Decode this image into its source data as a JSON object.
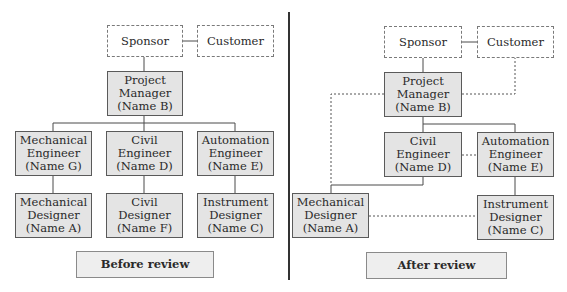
{
  "colors": {
    "box_fill": "#e4e4e4",
    "box_border": "#5a5a5a",
    "dashed_border": "#7a7a7a",
    "line": "#4a4a4a",
    "label_fill": "#eeeeee"
  },
  "before": {
    "caption": "Before review",
    "sponsor": "Sponsor",
    "customer": "Customer",
    "pm": {
      "l1": "Project",
      "l2": "Manager",
      "l3": "(Name B)"
    },
    "mech_eng": {
      "l1": "Mechanical",
      "l2": "Engineer",
      "l3": "(Name G)"
    },
    "civil_eng": {
      "l1": "Civil",
      "l2": "Engineer",
      "l3": "(Name D)"
    },
    "auto_eng": {
      "l1": "Automation",
      "l2": "Engineer",
      "l3": "(Name E)"
    },
    "mech_des": {
      "l1": "Mechanical",
      "l2": "Designer",
      "l3": "(Name A)"
    },
    "civil_des": {
      "l1": "Civil",
      "l2": "Designer",
      "l3": "(Name F)"
    },
    "inst_des": {
      "l1": "Instrument",
      "l2": "Designer",
      "l3": "(Name C)"
    }
  },
  "after": {
    "caption": "After review",
    "sponsor": "Sponsor",
    "customer": "Customer",
    "pm": {
      "l1": "Project",
      "l2": "Manager",
      "l3": "(Name B)"
    },
    "civil_eng": {
      "l1": "Civil",
      "l2": "Engineer",
      "l3": "(Name D)"
    },
    "auto_eng": {
      "l1": "Automation",
      "l2": "Engineer",
      "l3": "(Name E)"
    },
    "mech_des": {
      "l1": "Mechanical",
      "l2": "Designer",
      "l3": "(Name A)"
    },
    "inst_des": {
      "l1": "Instrument",
      "l2": "Designer",
      "l3": "(Name C)"
    }
  }
}
